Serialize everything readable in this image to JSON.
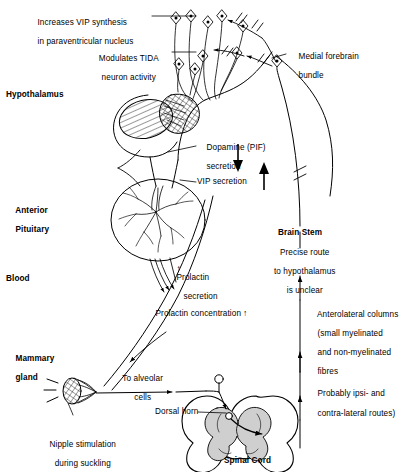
{
  "figure": {
    "background_color": "#ffffff",
    "ink_color": "#000000"
  },
  "region_labels": {
    "hypothalamus": "Hypothalamus",
    "anterior_pituitary_line1": "Anterior",
    "anterior_pituitary_line2": "Pituitary",
    "blood": "Blood",
    "mammary_gland_line1": "Mammary",
    "mammary_gland_line2": "gland",
    "spinal_cord": "Spinal Cord",
    "brain_stem": "Brain Stem"
  },
  "annotations": {
    "vip_synthesis_line1": "Increases VIP synthesis",
    "vip_synthesis_line2": "in paraventricular nucleus",
    "tida_line1": "Modulates TIDA",
    "tida_line2": "neuron activity",
    "medial_forebrain_line1": "Medial forebrain",
    "medial_forebrain_line2": "bundle",
    "dopamine_line1": "Dopamine (PIF)",
    "dopamine_line2": "secretion",
    "vip_secretion": "VIP secretion",
    "prolactin_secretion_line1": "Prolactin",
    "prolactin_secretion_line2": "secretion",
    "prolactin_concentration": "Prolactin concentration",
    "brain_stem_note_line1": "Precise route",
    "brain_stem_note_line2": "to hypothalamus",
    "brain_stem_note_line3": "is unclear",
    "anterolateral_line1": "Anterolateral columns",
    "anterolateral_line2": "(small myelinated",
    "anterolateral_line3": "and non-myelinated",
    "anterolateral_line4": "fibres",
    "anterolateral_line5": "Probably ipsi- and",
    "anterolateral_line6": "contra-lateral routes)",
    "to_alveolar_line1": "To alveolar",
    "to_alveolar_line2": "cells",
    "dorsal_horn": "Dorsal horn",
    "nipple_line1": "Nipple stimulation",
    "nipple_line2": "during suckling"
  },
  "glyphs": {
    "arrow_down": "↓",
    "arrow_up": "↑",
    "arrow_up_small": "↑"
  }
}
